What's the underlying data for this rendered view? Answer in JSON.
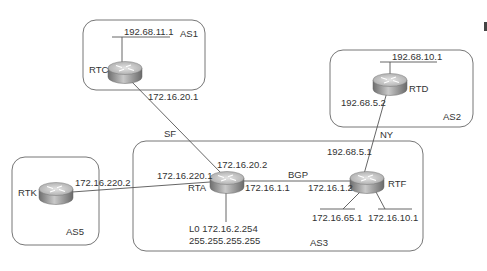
{
  "diagram": {
    "type": "network-topology",
    "autonomous_systems": [
      {
        "id": "AS1",
        "label": "AS1"
      },
      {
        "id": "AS2",
        "label": "AS2"
      },
      {
        "id": "AS3",
        "label": "AS3"
      },
      {
        "id": "AS5",
        "label": "AS5"
      }
    ],
    "routers": [
      {
        "id": "RTC",
        "label": "RTC",
        "as": "AS1"
      },
      {
        "id": "RTD",
        "label": "RTD",
        "as": "AS2"
      },
      {
        "id": "RTA",
        "label": "RTA",
        "as": "AS3"
      },
      {
        "id": "RTF",
        "label": "RTF",
        "as": "AS3"
      },
      {
        "id": "RTK",
        "label": "RTK",
        "as": "AS5"
      }
    ],
    "networks": {
      "rtc_lan": "192.68.11.1",
      "rtd_lan": "192.68.10.1",
      "rtf_lan1": "172.16.65.1",
      "rtf_lan2": "172.16.10.1",
      "rta_loopback": "L0 172.16.2.254",
      "rta_loopback_mask": "255.255.255.255"
    },
    "links": [
      {
        "from": "RTC",
        "to": "RTA",
        "label": "SF",
        "from_ip": "172.16.20.1",
        "to_ip": "172.16.20.2"
      },
      {
        "from": "RTD",
        "to": "RTF",
        "label": "NY",
        "from_ip": "192.68.5.2",
        "to_ip": "192.68.5.1"
      },
      {
        "from": "RTK",
        "to": "RTA",
        "label": "",
        "from_ip": "172.16.220.2",
        "to_ip": "172.16.220.1"
      },
      {
        "from": "RTA",
        "to": "RTF",
        "label": "BGP",
        "from_ip": "172.16.1.1",
        "to_ip": "172.16.1.2"
      }
    ]
  },
  "colors": {
    "line": "#555555",
    "box": "#666666",
    "router_top": "#d8d8d8",
    "router_side": "#8a8a8a",
    "text": "#333333"
  }
}
